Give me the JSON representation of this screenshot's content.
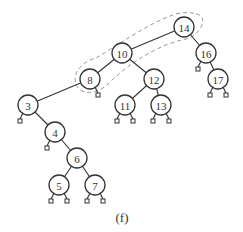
{
  "diagram": {
    "type": "binary-search-tree",
    "caption": "(f)",
    "highlighted_path": [
      "14",
      "10",
      "8"
    ],
    "colors": {
      "node_stroke": "#333333",
      "highlight_outline": "#999999"
    },
    "nodes": [
      {
        "id": "14",
        "label": "14"
      },
      {
        "id": "16",
        "label": "16"
      },
      {
        "id": "17",
        "label": "17"
      },
      {
        "id": "10",
        "label": "10"
      },
      {
        "id": "12",
        "label": "12"
      },
      {
        "id": "11",
        "label": "11"
      },
      {
        "id": "13",
        "label": "13"
      },
      {
        "id": "8",
        "label": "8"
      },
      {
        "id": "3",
        "label": "3"
      },
      {
        "id": "4",
        "label": "4"
      },
      {
        "id": "6",
        "label": "6"
      },
      {
        "id": "5",
        "label": "5"
      },
      {
        "id": "7",
        "label": "7"
      }
    ],
    "edges": [
      [
        "14",
        "10"
      ],
      [
        "14",
        "16"
      ],
      [
        "16",
        "17"
      ],
      [
        "10",
        "8"
      ],
      [
        "10",
        "12"
      ],
      [
        "12",
        "11"
      ],
      [
        "12",
        "13"
      ],
      [
        "8",
        "3"
      ],
      [
        "3",
        "4"
      ],
      [
        "4",
        "6"
      ],
      [
        "6",
        "5"
      ],
      [
        "6",
        "7"
      ]
    ],
    "null_leaves": [
      {
        "parent": "16",
        "side": "left"
      },
      {
        "parent": "17",
        "side": "left"
      },
      {
        "parent": "17",
        "side": "right"
      },
      {
        "parent": "8",
        "side": "right"
      },
      {
        "parent": "11",
        "side": "left"
      },
      {
        "parent": "11",
        "side": "right"
      },
      {
        "parent": "13",
        "side": "left"
      },
      {
        "parent": "13",
        "side": "right"
      },
      {
        "parent": "3",
        "side": "left"
      },
      {
        "parent": "4",
        "side": "left"
      },
      {
        "parent": "5",
        "side": "left"
      },
      {
        "parent": "5",
        "side": "right"
      },
      {
        "parent": "7",
        "side": "left"
      },
      {
        "parent": "7",
        "side": "right"
      }
    ]
  }
}
